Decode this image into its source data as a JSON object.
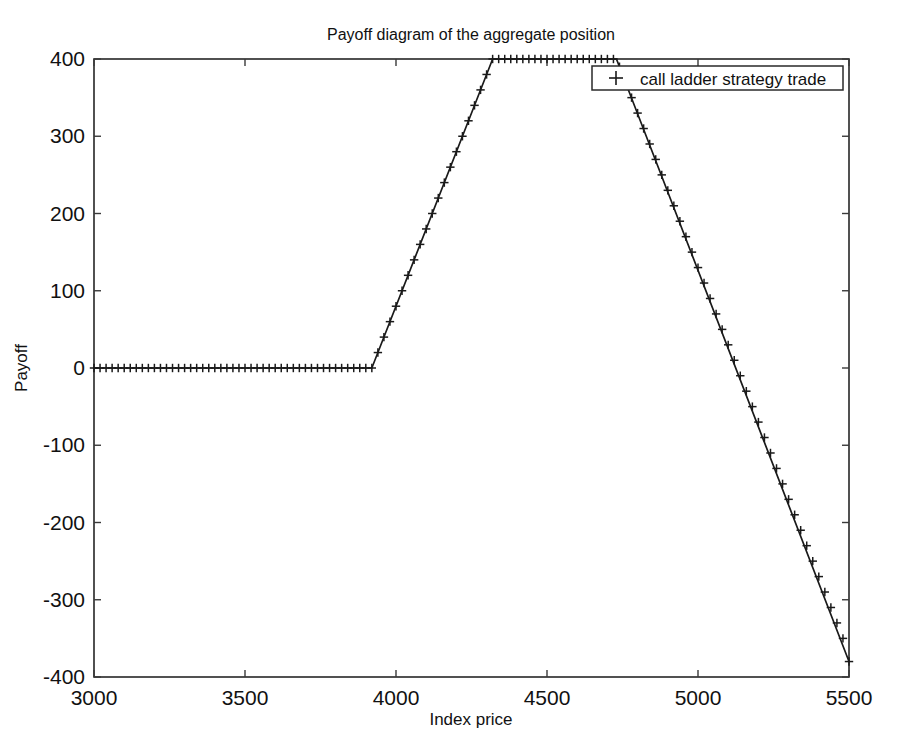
{
  "chart_data": {
    "type": "line",
    "title": "Payoff diagram of the aggregate position",
    "xlabel": "Index price",
    "ylabel": "Payoff",
    "xlim": [
      3000,
      5500
    ],
    "ylim": [
      -400,
      400
    ],
    "xticks": [
      3000,
      3500,
      4000,
      4500,
      5000,
      5500
    ],
    "xticklabels": [
      "3000",
      "3500",
      "4000",
      "4500",
      "5000",
      "5500"
    ],
    "yticks": [
      -400,
      -300,
      -200,
      -100,
      0,
      100,
      200,
      300,
      400
    ],
    "yticklabels": [
      "-400",
      "-300",
      "-200",
      "-100",
      "0",
      "100",
      "200",
      "300",
      "400"
    ],
    "grid": false,
    "legend_position": "top-right",
    "series": [
      {
        "name": "call ladder strategy trade",
        "marker": "+",
        "color": "#1a1a1a",
        "breakpoints_x": [
          3000,
          3920,
          4320,
          4730,
          5500
        ],
        "breakpoints_y": [
          0,
          0,
          400,
          400,
          -380
        ],
        "x": [
          3000,
          3020,
          3040,
          3060,
          3080,
          3100,
          3120,
          3140,
          3160,
          3180,
          3200,
          3220,
          3240,
          3260,
          3280,
          3300,
          3320,
          3340,
          3360,
          3380,
          3400,
          3420,
          3440,
          3460,
          3480,
          3500,
          3520,
          3540,
          3560,
          3580,
          3600,
          3620,
          3640,
          3660,
          3680,
          3700,
          3720,
          3740,
          3760,
          3780,
          3800,
          3820,
          3840,
          3860,
          3880,
          3900,
          3920,
          3940,
          3960,
          3980,
          4000,
          4020,
          4040,
          4060,
          4080,
          4100,
          4120,
          4140,
          4160,
          4180,
          4200,
          4220,
          4240,
          4260,
          4280,
          4300,
          4320,
          4340,
          4360,
          4380,
          4400,
          4420,
          4440,
          4460,
          4480,
          4500,
          4520,
          4540,
          4560,
          4580,
          4600,
          4620,
          4640,
          4660,
          4680,
          4700,
          4720,
          4740,
          4760,
          4780,
          4800,
          4820,
          4840,
          4860,
          4880,
          4900,
          4920,
          4940,
          4960,
          4980,
          5000,
          5020,
          5040,
          5060,
          5080,
          5100,
          5120,
          5140,
          5160,
          5180,
          5200,
          5220,
          5240,
          5260,
          5280,
          5300,
          5320,
          5340,
          5360,
          5380,
          5400,
          5420,
          5440,
          5460,
          5480,
          5500
        ],
        "y": [
          0,
          0,
          0,
          0,
          0,
          0,
          0,
          0,
          0,
          0,
          0,
          0,
          0,
          0,
          0,
          0,
          0,
          0,
          0,
          0,
          0,
          0,
          0,
          0,
          0,
          0,
          0,
          0,
          0,
          0,
          0,
          0,
          0,
          0,
          0,
          0,
          0,
          0,
          0,
          0,
          0,
          0,
          0,
          0,
          0,
          0,
          0,
          20,
          40,
          60,
          80,
          100,
          120,
          140,
          160,
          180,
          200,
          220,
          240,
          260,
          280,
          300,
          320,
          340,
          360,
          380,
          400,
          400,
          400,
          400,
          400,
          400,
          400,
          400,
          400,
          400,
          400,
          400,
          400,
          400,
          400,
          400,
          400,
          400,
          400,
          400,
          400,
          390,
          370,
          350,
          330,
          310,
          290,
          270,
          250,
          230,
          210,
          190,
          170,
          150,
          130,
          110,
          90,
          70,
          50,
          30,
          10,
          -10,
          -30,
          -50,
          -70,
          -90,
          -110,
          -130,
          -150,
          -170,
          -190,
          -210,
          -230,
          -250,
          -270,
          -290,
          -310,
          -330,
          -350,
          -380
        ]
      }
    ]
  },
  "legend": {
    "entries": [
      {
        "marker": "+",
        "label": "call ladder strategy trade"
      }
    ]
  }
}
